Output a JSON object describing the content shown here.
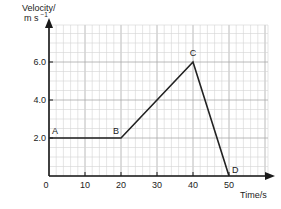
{
  "chart_data": {
    "type": "line",
    "title": "",
    "xlabel": "Time/s",
    "ylabel_line1": "Velocity/",
    "ylabel_line2": "m s",
    "ylabel_exp": "−1",
    "xlim": [
      0,
      60
    ],
    "ylim": [
      0,
      8
    ],
    "grid": true,
    "x_ticks": [
      0,
      10,
      20,
      30,
      40,
      50
    ],
    "x_tick_labels": [
      "0",
      "10",
      "20",
      "30",
      "40",
      "50"
    ],
    "y_ticks": [
      2.0,
      4.0,
      6.0
    ],
    "y_tick_labels": [
      "2.0",
      "4.0",
      "6.0"
    ],
    "series": [
      {
        "name": "velocity",
        "x": [
          0,
          20,
          40,
          50
        ],
        "y": [
          2.0,
          2.0,
          6.0,
          0.0
        ]
      }
    ],
    "annotations": [
      {
        "label": "A",
        "x": 0,
        "y": 2.0
      },
      {
        "label": "B",
        "x": 20,
        "y": 2.0
      },
      {
        "label": "C",
        "x": 40,
        "y": 6.0
      },
      {
        "label": "D",
        "x": 50,
        "y": 0.0
      }
    ],
    "legend": "none"
  },
  "colors": {
    "line": "#222222",
    "axis": "#1a1a1a",
    "grid_minor": "#d4d4d4",
    "grid_major": "#a8a8a8"
  }
}
